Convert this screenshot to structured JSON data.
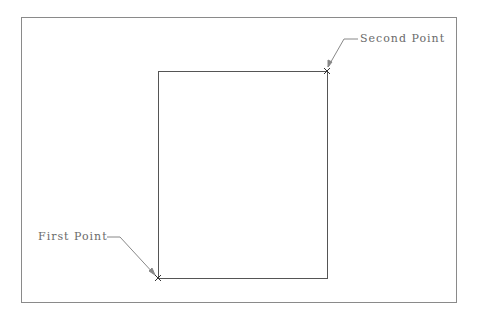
{
  "diagram": {
    "frame": {
      "x": 21,
      "y": 17,
      "width": 435,
      "height": 285,
      "color": "#8a8a8a"
    },
    "rectangle": {
      "x": 158,
      "y": 71,
      "width": 169,
      "height": 207,
      "color": "#555555"
    },
    "points": [
      {
        "name": "first",
        "label": "First Point",
        "x": 158,
        "y": 278
      },
      {
        "name": "second",
        "label": "Second Point",
        "x": 327,
        "y": 71
      }
    ]
  }
}
